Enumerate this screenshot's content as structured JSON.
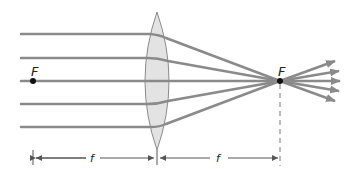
{
  "diagram": {
    "labels": {
      "left_focus": "F",
      "right_focus": "F",
      "left_distance": "f",
      "right_distance": "f"
    },
    "colors": {
      "ray": "#8a8a8a",
      "lens_fill": "#e3e3e3",
      "lens_stroke": "#8a8a8a",
      "dimension": "#555555",
      "focus_point": "#111111"
    },
    "rays_count": 5
  }
}
